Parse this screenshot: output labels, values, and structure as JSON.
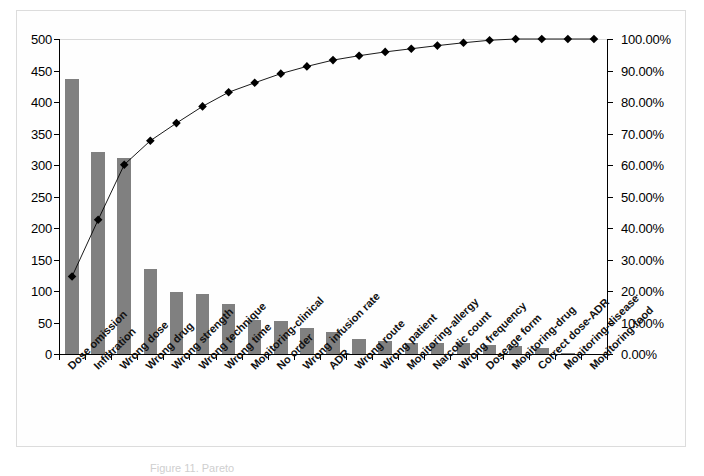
{
  "figure": {
    "caption": "Figure 11. Pareto"
  },
  "chart_data": {
    "type": "bar",
    "title": "",
    "subtitle": "",
    "xlabel": "",
    "ylabel": "",
    "y2label": "",
    "grid": false,
    "legend": null,
    "ylim": [
      0,
      500
    ],
    "y2lim": [
      0,
      100
    ],
    "y_ticks": [
      "0",
      "50",
      "100",
      "150",
      "200",
      "250",
      "300",
      "350",
      "400",
      "450",
      "500"
    ],
    "y2_ticks": [
      "0.00%",
      "10.00%",
      "20.00%",
      "30.00%",
      "40.00%",
      "50.00%",
      "60.00%",
      "70.00%",
      "80.00%",
      "90.00%",
      "100.00%"
    ],
    "categories": [
      "Dose omission",
      "Infiltration",
      "Wrong dose",
      "Wrong drug",
      "Wrong strength",
      "Wrong technique",
      "Wrong time",
      "Monitoring-clinical",
      "No order",
      "Wrong infusion rate",
      "ADR",
      "Wrong route",
      "Wrong patient",
      "Monitoring-allergy",
      "Narcotic count",
      "Wrong frequency",
      "Doseage form",
      "Monitoring-drug",
      "Correct dose-ADR",
      "Monitoring-disease",
      "Monitoring-food"
    ],
    "series": [
      {
        "name": "Frequency",
        "type": "bar",
        "axis": "left",
        "color": "#808080",
        "values": [
          437,
          321,
          311,
          135,
          99,
          95,
          79,
          54,
          52,
          41,
          35,
          24,
          21,
          18,
          18,
          17,
          14,
          12,
          9,
          1,
          0
        ]
      },
      {
        "name": "Cumulative %",
        "type": "line",
        "axis": "right",
        "color": "#000000",
        "marker": "diamond",
        "values": [
          24.6,
          42.6,
          60.1,
          67.7,
          73.3,
          78.6,
          83.1,
          86.1,
          89.0,
          91.3,
          93.3,
          94.7,
          95.9,
          96.9,
          97.9,
          98.8,
          99.6,
          100.0,
          100.0,
          100.0,
          100.0
        ]
      }
    ]
  },
  "colors": {
    "bar": "#808080",
    "line": "#000000",
    "axis": "#000000",
    "gridline": "#d9d9d9",
    "frame": "#dcdcdc",
    "background": "#ffffff"
  }
}
